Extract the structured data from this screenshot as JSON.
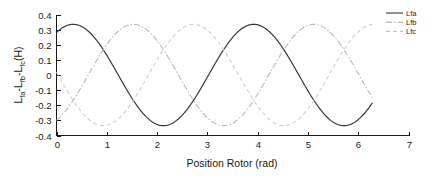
{
  "chart_data": {
    "type": "line",
    "title": "",
    "xlabel": "Position Rotor (rad)",
    "ylabel": "Lfa-Lfb-Lfc(H)",
    "ylabel_parts": {
      "p1": "L",
      "s1": "fa",
      "p2": "-L",
      "s2": "fb",
      "p3": "-L",
      "s3": "fc",
      "p4": "(H)"
    },
    "xlim": [
      0,
      7
    ],
    "ylim": [
      -0.4,
      0.4
    ],
    "xticks": [
      0,
      1,
      2,
      3,
      4,
      5,
      6,
      7
    ],
    "xtick_labels": [
      "0",
      "1",
      "2",
      "3",
      "4",
      "5",
      "6",
      "7"
    ],
    "yticks": [
      -0.4,
      -0.3,
      -0.2,
      -0.1,
      0,
      0.1,
      0.2,
      0.3,
      0.4
    ],
    "ytick_labels": [
      "-0.4",
      "-0.3",
      "-0.2",
      "-0.1",
      "0",
      "0.1",
      "0.2",
      "0.3",
      "0.4"
    ],
    "grid": false,
    "legend_position": "upper-right",
    "x_data_range": [
      0,
      6.2832
    ],
    "amplitude": 0.335,
    "series": [
      {
        "name": "Lfa",
        "label": "Lfa",
        "style": "solid",
        "color": "#3a3a3a",
        "phase": 0.0,
        "formula": "0.335*cos(1.75*x - 0.58)",
        "frequency": 1.75,
        "samples_x": [
          0.0,
          0.35,
          0.9,
          1.8,
          2.6,
          3.4,
          4.2,
          5.0,
          5.8,
          6.28
        ],
        "samples_y": [
          0.28,
          0.335,
          0.2,
          -0.335,
          0.0,
          0.335,
          0.05,
          -0.335,
          -0.05,
          0.29
        ]
      },
      {
        "name": "Lfb",
        "label": "Lfb",
        "style": "dashdot",
        "color": "#b9b9b9",
        "phase": 2.0944,
        "formula": "0.335*cos(1.75*x - 0.58 - 2.0944)",
        "frequency": 1.75,
        "samples_x": [
          0.0,
          0.8,
          1.33,
          2.4,
          2.95,
          3.9,
          4.5,
          5.5,
          6.1
        ],
        "samples_y": [
          -0.28,
          -0.335,
          0.335,
          0.1,
          -0.335,
          0.1,
          0.335,
          -0.1,
          -0.33
        ]
      },
      {
        "name": "Lfc",
        "label": "Lfc",
        "style": "dashed",
        "color": "#cfcfcf",
        "phase": 4.1888,
        "formula": "0.335*cos(1.75*x - 0.58 - 4.1888)",
        "frequency": 1.75,
        "samples_x": [
          0.0,
          0.75,
          1.6,
          2.35,
          3.2,
          4.0,
          4.8,
          5.6,
          6.28
        ],
        "samples_y": [
          -0.3,
          -0.335,
          0.1,
          0.335,
          -0.1,
          -0.33,
          0.2,
          0.33,
          0.05
        ]
      }
    ]
  },
  "legend": {
    "items": [
      {
        "label": "Lfa",
        "style": "solid",
        "color": "#3a3a3a"
      },
      {
        "label": "Lfb",
        "style": "dashdot",
        "color": "#a8a8a8"
      },
      {
        "label": "Lfc",
        "style": "dashed",
        "color": "#c4c4c4"
      }
    ]
  }
}
